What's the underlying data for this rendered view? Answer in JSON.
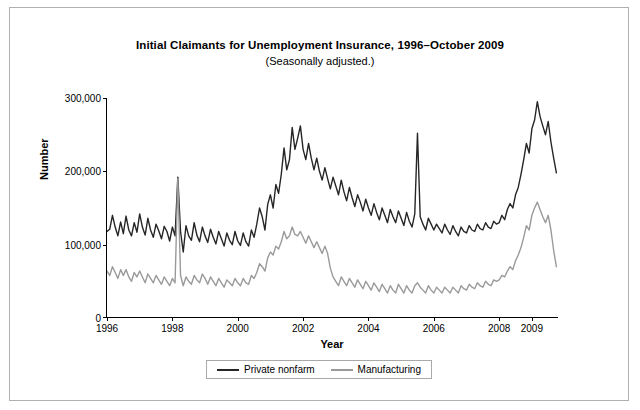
{
  "chart_data": {
    "type": "line",
    "title": "Initial Claimants for Unemployment Insurance, 1996–October 2009",
    "subtitle": "(Seasonally adjusted.)",
    "xlabel": "Year",
    "ylabel": "Number",
    "xlim": [
      1996,
      2009.83
    ],
    "ylim": [
      0,
      300000
    ],
    "grid": false,
    "legend_position": "bottom-center",
    "ytick_labels": [
      "0",
      "100,000",
      "200,000",
      "300,000"
    ],
    "ytick_values": [
      0,
      100000,
      200000,
      300000
    ],
    "xtick_labels": [
      "1996",
      "1998",
      "2000",
      "2002",
      "2004",
      "2006",
      "2008",
      "2009"
    ],
    "xtick_values": [
      1996,
      1998,
      2000,
      2002,
      2004,
      2006,
      2008,
      2009
    ],
    "colors": {
      "private_nonfarm": "#262626",
      "manufacturing": "#9a9a9a",
      "axis": "#000000",
      "frame": "#b0b0b0"
    },
    "series": [
      {
        "name": "Private nonfarm",
        "color": "#262626",
        "x": [
          1996.0,
          1996.083,
          1996.167,
          1996.25,
          1996.333,
          1996.417,
          1996.5,
          1996.583,
          1996.667,
          1996.75,
          1996.833,
          1996.917,
          1997.0,
          1997.083,
          1997.167,
          1997.25,
          1997.333,
          1997.417,
          1997.5,
          1997.583,
          1997.667,
          1997.75,
          1997.833,
          1997.917,
          1998.0,
          1998.083,
          1998.167,
          1998.25,
          1998.333,
          1998.417,
          1998.5,
          1998.583,
          1998.667,
          1998.75,
          1998.833,
          1998.917,
          1999.0,
          1999.083,
          1999.167,
          1999.25,
          1999.333,
          1999.417,
          1999.5,
          1999.583,
          1999.667,
          1999.75,
          1999.833,
          1999.917,
          2000.0,
          2000.083,
          2000.167,
          2000.25,
          2000.333,
          2000.417,
          2000.5,
          2000.583,
          2000.667,
          2000.75,
          2000.833,
          2000.917,
          2001.0,
          2001.083,
          2001.167,
          2001.25,
          2001.333,
          2001.417,
          2001.5,
          2001.583,
          2001.667,
          2001.75,
          2001.833,
          2001.917,
          2002.0,
          2002.083,
          2002.167,
          2002.25,
          2002.333,
          2002.417,
          2002.5,
          2002.583,
          2002.667,
          2002.75,
          2002.833,
          2002.917,
          2003.0,
          2003.083,
          2003.167,
          2003.25,
          2003.333,
          2003.417,
          2003.5,
          2003.583,
          2003.667,
          2003.75,
          2003.833,
          2003.917,
          2004.0,
          2004.083,
          2004.167,
          2004.25,
          2004.333,
          2004.417,
          2004.5,
          2004.583,
          2004.667,
          2004.75,
          2004.833,
          2004.917,
          2005.0,
          2005.083,
          2005.167,
          2005.25,
          2005.333,
          2005.417,
          2005.5,
          2005.583,
          2005.667,
          2005.75,
          2005.833,
          2005.917,
          2006.0,
          2006.083,
          2006.167,
          2006.25,
          2006.333,
          2006.417,
          2006.5,
          2006.583,
          2006.667,
          2006.75,
          2006.833,
          2006.917,
          2007.0,
          2007.083,
          2007.167,
          2007.25,
          2007.333,
          2007.417,
          2007.5,
          2007.583,
          2007.667,
          2007.75,
          2007.833,
          2007.917,
          2008.0,
          2008.083,
          2008.167,
          2008.25,
          2008.333,
          2008.417,
          2008.5,
          2008.583,
          2008.667,
          2008.75,
          2008.833,
          2008.917,
          2009.0,
          2009.083,
          2009.167,
          2009.25,
          2009.333,
          2009.417,
          2009.5,
          2009.583,
          2009.667,
          2009.75
        ],
        "values": [
          118000,
          121000,
          140000,
          124000,
          112000,
          131000,
          115000,
          139000,
          120000,
          112000,
          130000,
          117000,
          142000,
          124000,
          113000,
          136000,
          120000,
          110000,
          128000,
          119000,
          108000,
          125000,
          118000,
          105000,
          124000,
          112000,
          192000,
          118000,
          90000,
          126000,
          112000,
          106000,
          130000,
          113000,
          104000,
          124000,
          112000,
          103000,
          121000,
          110000,
          101000,
          118000,
          108000,
          98000,
          116000,
          106000,
          100000,
          118000,
          105000,
          99000,
          116000,
          104000,
          98000,
          120000,
          110000,
          128000,
          150000,
          138000,
          120000,
          155000,
          168000,
          150000,
          182000,
          170000,
          196000,
          232000,
          202000,
          216000,
          260000,
          230000,
          245000,
          262000,
          230000,
          216000,
          238000,
          218000,
          202000,
          218000,
          200000,
          188000,
          205000,
          190000,
          176000,
          192000,
          180000,
          168000,
          188000,
          172000,
          160000,
          178000,
          164000,
          152000,
          168000,
          158000,
          146000,
          162000,
          150000,
          140000,
          156000,
          144000,
          134000,
          150000,
          140000,
          130000,
          148000,
          138000,
          130000,
          146000,
          136000,
          126000,
          144000,
          132000,
          124000,
          142000,
          252000,
          138000,
          128000,
          120000,
          136000,
          128000,
          120000,
          128000,
          122000,
          116000,
          128000,
          120000,
          114000,
          126000,
          118000,
          112000,
          124000,
          118000,
          116000,
          126000,
          120000,
          118000,
          128000,
          122000,
          120000,
          130000,
          124000,
          122000,
          132000,
          128000,
          130000,
          140000,
          134000,
          148000,
          156000,
          150000,
          168000,
          178000,
          196000,
          216000,
          238000,
          225000,
          258000,
          270000,
          295000,
          275000,
          262000,
          250000,
          268000,
          240000,
          218000,
          198000
        ]
      },
      {
        "name": "Manufacturing",
        "color": "#9a9a9a",
        "x": [
          1996.0,
          1996.083,
          1996.167,
          1996.25,
          1996.333,
          1996.417,
          1996.5,
          1996.583,
          1996.667,
          1996.75,
          1996.833,
          1996.917,
          1997.0,
          1997.083,
          1997.167,
          1997.25,
          1997.333,
          1997.417,
          1997.5,
          1997.583,
          1997.667,
          1997.75,
          1997.833,
          1997.917,
          1998.0,
          1998.083,
          1998.167,
          1998.25,
          1998.333,
          1998.417,
          1998.5,
          1998.583,
          1998.667,
          1998.75,
          1998.833,
          1998.917,
          1999.0,
          1999.083,
          1999.167,
          1999.25,
          1999.333,
          1999.417,
          1999.5,
          1999.583,
          1999.667,
          1999.75,
          1999.833,
          1999.917,
          2000.0,
          2000.083,
          2000.167,
          2000.25,
          2000.333,
          2000.417,
          2000.5,
          2000.583,
          2000.667,
          2000.75,
          2000.833,
          2000.917,
          2001.0,
          2001.083,
          2001.167,
          2001.25,
          2001.333,
          2001.417,
          2001.5,
          2001.583,
          2001.667,
          2001.75,
          2001.833,
          2001.917,
          2002.0,
          2002.083,
          2002.167,
          2002.25,
          2002.333,
          2002.417,
          2002.5,
          2002.583,
          2002.667,
          2002.75,
          2002.833,
          2002.917,
          2003.0,
          2003.083,
          2003.167,
          2003.25,
          2003.333,
          2003.417,
          2003.5,
          2003.583,
          2003.667,
          2003.75,
          2003.833,
          2003.917,
          2004.0,
          2004.083,
          2004.167,
          2004.25,
          2004.333,
          2004.417,
          2004.5,
          2004.583,
          2004.667,
          2004.75,
          2004.833,
          2004.917,
          2005.0,
          2005.083,
          2005.167,
          2005.25,
          2005.333,
          2005.417,
          2005.5,
          2005.583,
          2005.667,
          2005.75,
          2005.833,
          2005.917,
          2006.0,
          2006.083,
          2006.167,
          2006.25,
          2006.333,
          2006.417,
          2006.5,
          2006.583,
          2006.667,
          2006.75,
          2006.833,
          2006.917,
          2007.0,
          2007.083,
          2007.167,
          2007.25,
          2007.333,
          2007.417,
          2007.5,
          2007.583,
          2007.667,
          2007.75,
          2007.833,
          2007.917,
          2008.0,
          2008.083,
          2008.167,
          2008.25,
          2008.333,
          2008.417,
          2008.5,
          2008.583,
          2008.667,
          2008.75,
          2008.833,
          2008.917,
          2009.0,
          2009.083,
          2009.167,
          2009.25,
          2009.333,
          2009.417,
          2009.5,
          2009.583,
          2009.667,
          2009.75
        ],
        "values": [
          64000,
          58000,
          70000,
          62000,
          54000,
          66000,
          58000,
          66000,
          56000,
          50000,
          62000,
          56000,
          64000,
          56000,
          48000,
          60000,
          54000,
          48000,
          58000,
          52000,
          46000,
          56000,
          50000,
          44000,
          54000,
          48000,
          190000,
          58000,
          44000,
          56000,
          50000,
          46000,
          58000,
          52000,
          48000,
          60000,
          54000,
          46000,
          56000,
          50000,
          44000,
          54000,
          48000,
          42000,
          52000,
          48000,
          44000,
          54000,
          48000,
          44000,
          54000,
          48000,
          46000,
          58000,
          54000,
          62000,
          74000,
          70000,
          64000,
          82000,
          90000,
          86000,
          98000,
          94000,
          104000,
          118000,
          108000,
          112000,
          124000,
          114000,
          112000,
          118000,
          110000,
          102000,
          112000,
          104000,
          96000,
          104000,
          96000,
          88000,
          98000,
          88000,
          68000,
          56000,
          50000,
          44000,
          56000,
          50000,
          44000,
          54000,
          48000,
          42000,
          52000,
          46000,
          40000,
          50000,
          44000,
          38000,
          48000,
          42000,
          36000,
          46000,
          40000,
          34000,
          44000,
          38000,
          34000,
          46000,
          40000,
          34000,
          44000,
          38000,
          34000,
          44000,
          48000,
          42000,
          38000,
          34000,
          44000,
          38000,
          34000,
          42000,
          38000,
          34000,
          42000,
          38000,
          34000,
          42000,
          38000,
          34000,
          44000,
          40000,
          38000,
          46000,
          42000,
          40000,
          48000,
          44000,
          42000,
          50000,
          46000,
          44000,
          52000,
          50000,
          52000,
          58000,
          56000,
          64000,
          70000,
          66000,
          78000,
          86000,
          96000,
          110000,
          126000,
          120000,
          140000,
          150000,
          158000,
          148000,
          138000,
          130000,
          140000,
          120000,
          92000,
          70000
        ]
      }
    ]
  },
  "legend": {
    "items": [
      {
        "label": "Private nonfarm",
        "color": "#262626"
      },
      {
        "label": "Manufacturing",
        "color": "#9a9a9a"
      }
    ]
  }
}
